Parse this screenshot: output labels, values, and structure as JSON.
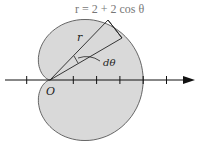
{
  "diagram": {
    "equation": "r = 2 + 2 cos θ",
    "labels": {
      "radius": "r",
      "angle": "dθ",
      "origin": "O"
    },
    "curve": "cardioid",
    "colors": {
      "fill": "#d9d9d9",
      "stroke": "#333333",
      "background": "#ffffff"
    },
    "axis": {
      "ticks_left": [
        -1
      ],
      "ticks_right": [
        1,
        2,
        3,
        4,
        5
      ]
    }
  }
}
